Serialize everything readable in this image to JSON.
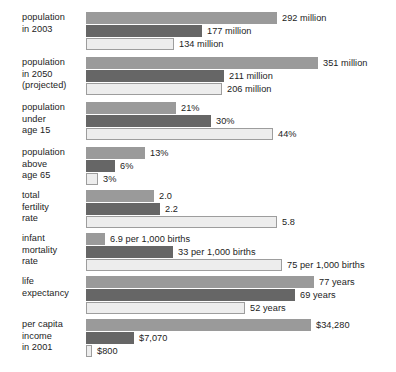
{
  "chart_data": {
    "type": "bar",
    "title": "",
    "subtitle": "",
    "xlabel": "",
    "ylabel": "",
    "orientation": "horizontal",
    "grid": false,
    "legend": "none",
    "series": [
      {
        "name": "series-1",
        "color": "#9a9a9a"
      },
      {
        "name": "series-2",
        "color": "#666666"
      },
      {
        "name": "series-3",
        "color": "#ededed"
      }
    ],
    "groups": [
      {
        "label": "population\nin 2003",
        "label_lines": [
          "population",
          "in 2003"
        ],
        "bars": [
          {
            "value": 292,
            "label": "292 million",
            "width": 191
          },
          {
            "value": 177,
            "label": "177 million",
            "width": 116
          },
          {
            "value": 134,
            "label": "134 million",
            "width": 88
          }
        ]
      },
      {
        "label": "population\nin 2050\n(projected)",
        "label_lines": [
          "population",
          "in 2050",
          "(projected)"
        ],
        "bars": [
          {
            "value": 351,
            "label": "351 million",
            "width": 232
          },
          {
            "value": 211,
            "label": "211 million",
            "width": 138
          },
          {
            "value": 206,
            "label": "206 million",
            "width": 136
          }
        ]
      },
      {
        "label": "population\nunder\nage 15",
        "label_lines": [
          "population",
          "under",
          "age 15"
        ],
        "bars": [
          {
            "value": 21,
            "label": "21%",
            "width": 90
          },
          {
            "value": 30,
            "label": "30%",
            "width": 125
          },
          {
            "value": 44,
            "label": "44%",
            "width": 187
          }
        ]
      },
      {
        "label": "population\nabove\nage 65",
        "label_lines": [
          "population",
          "above",
          "age 65"
        ],
        "bars": [
          {
            "value": 13,
            "label": "13%",
            "width": 59
          },
          {
            "value": 6,
            "label": "6%",
            "width": 29
          },
          {
            "value": 3,
            "label": "3%",
            "width": 12
          }
        ]
      },
      {
        "label": "total\nfertility\nrate",
        "label_lines": [
          "total",
          "fertility",
          "rate"
        ],
        "bars": [
          {
            "value": 2.0,
            "label": "2.0",
            "width": 68
          },
          {
            "value": 2.2,
            "label": "2.2",
            "width": 74
          },
          {
            "value": 5.8,
            "label": "5.8",
            "width": 191
          }
        ]
      },
      {
        "label": "infant\nmortality\nrate",
        "label_lines": [
          "infant",
          "mortality",
          "rate"
        ],
        "bars": [
          {
            "value": 6.9,
            "label": "6.9 per 1,000 births",
            "width": 19
          },
          {
            "value": 33,
            "label": "33 per 1,000 births",
            "width": 87
          },
          {
            "value": 75,
            "label": "75 per 1,000 births",
            "width": 196
          }
        ]
      },
      {
        "label": "life\nexpectancy",
        "label_lines": [
          "life",
          "expectancy"
        ],
        "bars": [
          {
            "value": 77,
            "label": "77 years",
            "width": 228
          },
          {
            "value": 69,
            "label": "69 years",
            "width": 209
          },
          {
            "value": 52,
            "label": "52 years",
            "width": 159
          }
        ]
      },
      {
        "label": "per capita\nincome\nin 2001",
        "label_lines": [
          "per capita",
          "income",
          "in 2001"
        ],
        "bars": [
          {
            "value": 34280,
            "label": "$34,280",
            "width": 225
          },
          {
            "value": 7070,
            "label": "$7,070",
            "width": 48
          },
          {
            "value": 800,
            "label": "$800",
            "width": 6
          }
        ]
      }
    ]
  }
}
